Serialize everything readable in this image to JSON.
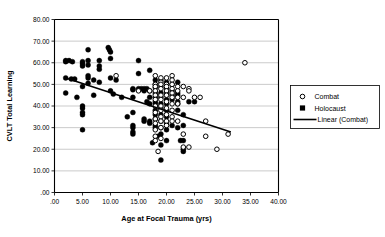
{
  "chart_data": {
    "type": "scatter",
    "title": "",
    "xlabel": "Age at Focal Trauma (yrs)",
    "ylabel": "CVLT Total Learning",
    "xlim": [
      0,
      40
    ],
    "ylim": [
      0,
      80
    ],
    "xticks": [
      0,
      5,
      10,
      15,
      20,
      25,
      30,
      35,
      40
    ],
    "yticks": [
      0,
      10,
      20,
      30,
      40,
      50,
      60,
      70,
      80
    ],
    "xticklabels": [
      ".00",
      "5.00",
      "10.00",
      "15.00",
      "20.00",
      "25.00",
      "30.00",
      "35.00",
      "40.00"
    ],
    "yticklabels": [
      ".00",
      "10.00",
      "20.00",
      "30.00",
      "40.00",
      "50.00",
      "60.00",
      "70.00",
      "80.00"
    ],
    "grid": "horizontal",
    "legend_position": "right-outside",
    "legend": [
      {
        "label": "Combat",
        "marker": "open-circle"
      },
      {
        "label": "Holocaust",
        "marker": "filled-square"
      },
      {
        "label": "Linear (Combat)",
        "marker": "line"
      }
    ],
    "series": [
      {
        "name": "Holocaust",
        "marker": "filled-circle",
        "color": "#000000",
        "points": [
          [
            2,
            61
          ],
          [
            2,
            60.5
          ],
          [
            2.6,
            61
          ],
          [
            3.2,
            60.5
          ],
          [
            2,
            53
          ],
          [
            2,
            46
          ],
          [
            3,
            52.5
          ],
          [
            3.6,
            52.5
          ],
          [
            4,
            44
          ],
          [
            5,
            60.5
          ],
          [
            5,
            59.5
          ],
          [
            5,
            58.5
          ],
          [
            5,
            49
          ],
          [
            5,
            40
          ],
          [
            5,
            39
          ],
          [
            5,
            37
          ],
          [
            5,
            36
          ],
          [
            5,
            29
          ],
          [
            6,
            66
          ],
          [
            6,
            61
          ],
          [
            6,
            59
          ],
          [
            6,
            54
          ],
          [
            6,
            53
          ],
          [
            6,
            50.5
          ],
          [
            7,
            52
          ],
          [
            7,
            45
          ],
          [
            8,
            61
          ],
          [
            8,
            58.5
          ],
          [
            8,
            57
          ],
          [
            8,
            51
          ],
          [
            9.6,
            67
          ],
          [
            9.8,
            66
          ],
          [
            10,
            65
          ],
          [
            10,
            62
          ],
          [
            10,
            53
          ],
          [
            10,
            47
          ],
          [
            10.5,
            45.5
          ],
          [
            11,
            52
          ],
          [
            12,
            44
          ],
          [
            13,
            35
          ],
          [
            14,
            48
          ],
          [
            14,
            47.5
          ],
          [
            14,
            44
          ],
          [
            14,
            37
          ],
          [
            14,
            31
          ],
          [
            14,
            30
          ],
          [
            14,
            28
          ],
          [
            14,
            27
          ],
          [
            15,
            61
          ],
          [
            15,
            55
          ],
          [
            15,
            48
          ],
          [
            15.5,
            48
          ],
          [
            16,
            48
          ],
          [
            16.5,
            48
          ],
          [
            16,
            47
          ],
          [
            16.5,
            42
          ],
          [
            16,
            34
          ],
          [
            16,
            33
          ],
          [
            17,
            56.5
          ],
          [
            17,
            47
          ],
          [
            17,
            44
          ],
          [
            17,
            41
          ],
          [
            17,
            33
          ],
          [
            17,
            32
          ],
          [
            17.5,
            23
          ],
          [
            18,
            52
          ],
          [
            18,
            50
          ],
          [
            18,
            48.5
          ],
          [
            18,
            46
          ],
          [
            18,
            44
          ],
          [
            18,
            42
          ],
          [
            18,
            41
          ],
          [
            18,
            38
          ],
          [
            18,
            36
          ],
          [
            18,
            34
          ],
          [
            18,
            31
          ],
          [
            18,
            30
          ],
          [
            18.5,
            26
          ],
          [
            19,
            52
          ],
          [
            19,
            49
          ],
          [
            19,
            46
          ],
          [
            19,
            44
          ],
          [
            19,
            41
          ],
          [
            19,
            39
          ],
          [
            19,
            36
          ],
          [
            19,
            33
          ],
          [
            19,
            30
          ],
          [
            19,
            27
          ],
          [
            19,
            22
          ],
          [
            19,
            15
          ],
          [
            20,
            51
          ],
          [
            20,
            48
          ],
          [
            20,
            46
          ],
          [
            20,
            43
          ],
          [
            20,
            41
          ],
          [
            20,
            38
          ],
          [
            20,
            35
          ],
          [
            20,
            32
          ],
          [
            20,
            29
          ],
          [
            20,
            24
          ],
          [
            21,
            50
          ],
          [
            21,
            47
          ],
          [
            21,
            45
          ],
          [
            21,
            43
          ],
          [
            21,
            31
          ],
          [
            22,
            51
          ],
          [
            22,
            46
          ],
          [
            22,
            45
          ],
          [
            22,
            42
          ],
          [
            22,
            41
          ],
          [
            22,
            38
          ],
          [
            22,
            30
          ],
          [
            22.5,
            24
          ],
          [
            23,
            36
          ],
          [
            23,
            31
          ],
          [
            23,
            24
          ],
          [
            23,
            19
          ],
          [
            23,
            20
          ],
          [
            24,
            42
          ],
          [
            25,
            42
          ]
        ]
      },
      {
        "name": "Combat",
        "marker": "open-circle",
        "color": "#ffffff",
        "points": [
          [
            11,
            54
          ],
          [
            15,
            47
          ],
          [
            17,
            47
          ],
          [
            18,
            54
          ],
          [
            18,
            50
          ],
          [
            18,
            49
          ],
          [
            18,
            47
          ],
          [
            18,
            45
          ],
          [
            18,
            43
          ],
          [
            18,
            40
          ],
          [
            18,
            37
          ],
          [
            18,
            34
          ],
          [
            18,
            32
          ],
          [
            18,
            29
          ],
          [
            18,
            26
          ],
          [
            18,
            24
          ],
          [
            18.5,
            19
          ],
          [
            19,
            53
          ],
          [
            19,
            51
          ],
          [
            19,
            50
          ],
          [
            19,
            48
          ],
          [
            19,
            45
          ],
          [
            19,
            43
          ],
          [
            19,
            40
          ],
          [
            19,
            38
          ],
          [
            19,
            35
          ],
          [
            19,
            33
          ],
          [
            19,
            30
          ],
          [
            19,
            25
          ],
          [
            20,
            53
          ],
          [
            20,
            50
          ],
          [
            20,
            49
          ],
          [
            20,
            47
          ],
          [
            20,
            45
          ],
          [
            20,
            42
          ],
          [
            20,
            39
          ],
          [
            20,
            36
          ],
          [
            20,
            33
          ],
          [
            20,
            31
          ],
          [
            21,
            54
          ],
          [
            21,
            52
          ],
          [
            21,
            50
          ],
          [
            21,
            48
          ],
          [
            21,
            46
          ],
          [
            21,
            44
          ],
          [
            21,
            41
          ],
          [
            21,
            38
          ],
          [
            21,
            35
          ],
          [
            21,
            33
          ],
          [
            22,
            49
          ],
          [
            22,
            47
          ],
          [
            22,
            44
          ],
          [
            22,
            41
          ],
          [
            22,
            33
          ],
          [
            23,
            49
          ],
          [
            23,
            44
          ],
          [
            23,
            27
          ],
          [
            23,
            21
          ],
          [
            24,
            48
          ],
          [
            24,
            47
          ],
          [
            24,
            21
          ],
          [
            25,
            44
          ],
          [
            26,
            44
          ],
          [
            27,
            33
          ],
          [
            27,
            26
          ],
          [
            29,
            20
          ],
          [
            31,
            27
          ],
          [
            34,
            60
          ]
        ]
      }
    ],
    "trendline": {
      "name": "Linear (Combat)",
      "x_start": 2.0,
      "y_start": 53.0,
      "x_end": 31.5,
      "y_end": 28.0
    }
  }
}
